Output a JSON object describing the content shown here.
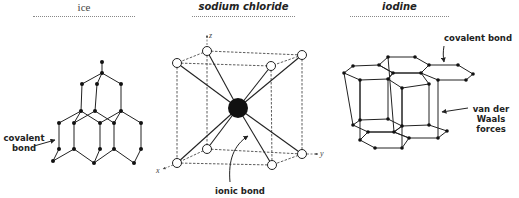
{
  "panels": [
    {
      "id": "ice",
      "title": "ice",
      "annotations": [
        {
          "text_line1": "covalent",
          "text_line2": "bond"
        }
      ]
    },
    {
      "id": "sodium-chloride",
      "title": "sodium chloride",
      "annotations": [
        {
          "text": "ionic bond"
        }
      ],
      "axes": {
        "x": "x",
        "y": "y",
        "z": "z"
      }
    },
    {
      "id": "iodine",
      "title": "iodine",
      "annotations": [
        {
          "text": "covalent bond"
        },
        {
          "text_line1": "van der",
          "text_line2": "Waals",
          "text_line3": "forces"
        }
      ]
    }
  ],
  "colors": {
    "ink": "#222222",
    "dotted": "#888888",
    "background": "#ffffff"
  }
}
